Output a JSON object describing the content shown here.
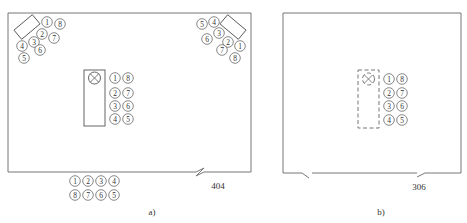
{
  "figure": {
    "panel_a": {
      "caption": "a)",
      "reference_label": "404",
      "top_left_group": [
        {
          "n": "1",
          "x": 47,
          "y": 22
        },
        {
          "n": "8",
          "x": 60,
          "y": 24
        },
        {
          "n": "2",
          "x": 42,
          "y": 34
        },
        {
          "n": "7",
          "x": 54,
          "y": 38
        },
        {
          "n": "3",
          "x": 34,
          "y": 42
        },
        {
          "n": "4",
          "x": 22,
          "y": 46
        },
        {
          "n": "6",
          "x": 40,
          "y": 50
        },
        {
          "n": "5",
          "x": 24,
          "y": 58
        }
      ],
      "top_right_group": [
        {
          "n": "5",
          "x": 202,
          "y": 24
        },
        {
          "n": "4",
          "x": 214,
          "y": 22
        },
        {
          "n": "3",
          "x": 219,
          "y": 33
        },
        {
          "n": "6",
          "x": 207,
          "y": 39
        },
        {
          "n": "2",
          "x": 228,
          "y": 42
        },
        {
          "n": "1",
          "x": 240,
          "y": 46
        },
        {
          "n": "7",
          "x": 222,
          "y": 50
        },
        {
          "n": "8",
          "x": 235,
          "y": 58
        }
      ],
      "center_group": [
        {
          "n": "1",
          "x": 115,
          "y": 78
        },
        {
          "n": "8",
          "x": 128,
          "y": 78
        },
        {
          "n": "2",
          "x": 115,
          "y": 93
        },
        {
          "n": "7",
          "x": 128,
          "y": 93
        },
        {
          "n": "3",
          "x": 115,
          "y": 106
        },
        {
          "n": "6",
          "x": 128,
          "y": 106
        },
        {
          "n": "4",
          "x": 115,
          "y": 119
        },
        {
          "n": "5",
          "x": 128,
          "y": 119
        }
      ],
      "bottom_group": [
        {
          "n": "1",
          "x": 75,
          "y": 181
        },
        {
          "n": "2",
          "x": 88,
          "y": 181
        },
        {
          "n": "3",
          "x": 101,
          "y": 181
        },
        {
          "n": "4",
          "x": 114,
          "y": 181
        },
        {
          "n": "8",
          "x": 75,
          "y": 195
        },
        {
          "n": "7",
          "x": 88,
          "y": 195
        },
        {
          "n": "6",
          "x": 101,
          "y": 195
        },
        {
          "n": "5",
          "x": 114,
          "y": 195
        }
      ]
    },
    "panel_b": {
      "caption": "b)",
      "reference_label": "306",
      "center_group": [
        {
          "n": "1",
          "x": 389,
          "y": 79
        },
        {
          "n": "8",
          "x": 402,
          "y": 79
        },
        {
          "n": "2",
          "x": 389,
          "y": 93
        },
        {
          "n": "7",
          "x": 402,
          "y": 93
        },
        {
          "n": "3",
          "x": 389,
          "y": 106
        },
        {
          "n": "6",
          "x": 402,
          "y": 106
        },
        {
          "n": "4",
          "x": 389,
          "y": 120
        },
        {
          "n": "5",
          "x": 402,
          "y": 120
        }
      ]
    }
  }
}
